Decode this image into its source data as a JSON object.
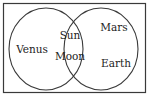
{
  "diagram": {
    "type": "venn",
    "colors": {
      "line": "#3a3a3a",
      "text": "#222222",
      "background": "#ffffff"
    },
    "sets": [
      {
        "name": "left-set",
        "only": [
          "Venus"
        ]
      },
      {
        "name": "right-set",
        "only": [
          "Mars",
          "Earth"
        ]
      }
    ],
    "intersection": [
      "Sun",
      "Moon"
    ],
    "labels": {
      "venus": "Venus",
      "sun": "Sun",
      "moon": "Moon",
      "mars": "Mars",
      "earth": "Earth"
    }
  }
}
